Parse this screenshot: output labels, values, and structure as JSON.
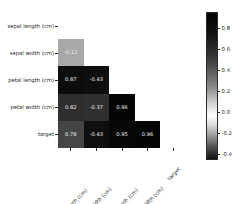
{
  "chart_data": {
    "type": "heatmap",
    "title": "",
    "xlabel": "",
    "ylabel": "",
    "mask": "lower-triangle",
    "grid": false,
    "annotated": true,
    "categories": [
      "sepal length (cm)",
      "sepal width (cm)",
      "petal length (cm)",
      "petal width (cm)",
      "target"
    ],
    "x_tick_labels": [
      "sepal length (cm)",
      "sepal width (cm)",
      "petal length (cm)",
      "petal width (cm)",
      "target"
    ],
    "y_tick_labels": [
      "sepal length (cm)",
      "sepal width (cm)",
      "petal length (cm)",
      "petal width (cm)",
      "target"
    ],
    "x_tick_rotation": -45,
    "rows": [
      {
        "label": "sepal length (cm)",
        "cells": []
      },
      {
        "label": "sepal width (cm)",
        "cells": [
          {
            "col": "sepal length (cm)",
            "value": -0.12,
            "text": "-0.12",
            "fill": "#a8a8a8",
            "text_color": "#e8e8e8"
          }
        ]
      },
      {
        "label": "petal length (cm)",
        "cells": [
          {
            "col": "sepal length (cm)",
            "value": 0.87,
            "text": "0.87",
            "fill": "#0d0d0d",
            "text_color": "#f2f2f2"
          },
          {
            "col": "sepal width (cm)",
            "value": -0.43,
            "text": "-0.43",
            "fill": "#0f0f0f",
            "text_color": "#f2f2f2"
          }
        ]
      },
      {
        "label": "petal width (cm)",
        "cells": [
          {
            "col": "sepal length (cm)",
            "value": 0.82,
            "text": "0.82",
            "fill": "#2e2e2e",
            "text_color": "#f2f2f2"
          },
          {
            "col": "sepal width (cm)",
            "value": -0.37,
            "text": "-0.37",
            "fill": "#303030",
            "text_color": "#f2f2f2"
          },
          {
            "col": "petal length (cm)",
            "value": 0.96,
            "text": "0.96",
            "fill": "#050505",
            "text_color": "#f7f7f7"
          }
        ]
      },
      {
        "label": "target",
        "cells": [
          {
            "col": "sepal length (cm)",
            "value": 0.78,
            "text": "0.78",
            "fill": "#454545",
            "text_color": "#f2f2f2"
          },
          {
            "col": "sepal width (cm)",
            "value": -0.43,
            "text": "-0.43",
            "fill": "#0f0f0f",
            "text_color": "#f2f2f2"
          },
          {
            "col": "petal length (cm)",
            "value": 0.95,
            "text": "0.95",
            "fill": "#070707",
            "text_color": "#f7f7f7"
          },
          {
            "col": "petal width (cm)",
            "value": 0.96,
            "text": "0.96",
            "fill": "#050505",
            "text_color": "#f7f7f7"
          }
        ]
      }
    ],
    "colorbar": {
      "orientation": "vertical",
      "position": "right",
      "vmin": -0.45,
      "vmax": 0.96,
      "colormap": "diverging-gray",
      "ticks": [
        {
          "value": 0.8,
          "label": "0.8"
        },
        {
          "value": 0.6,
          "label": "0.6"
        },
        {
          "value": 0.4,
          "label": "0.4"
        },
        {
          "value": 0.2,
          "label": "0.2"
        },
        {
          "value": 0.0,
          "label": "0.0"
        },
        {
          "value": -0.2,
          "label": "-0.2"
        },
        {
          "value": -0.4,
          "label": "-0.4"
        }
      ],
      "gradient_stops": [
        {
          "pos": 0,
          "color": "#000000"
        },
        {
          "pos": 14,
          "color": "#111111"
        },
        {
          "pos": 32,
          "color": "#3d3d3d"
        },
        {
          "pos": 50,
          "color": "#858585"
        },
        {
          "pos": 62,
          "color": "#d4d4d4"
        },
        {
          "pos": 70,
          "color": "#fdfdfd"
        },
        {
          "pos": 76,
          "color": "#e0e0e0"
        },
        {
          "pos": 84,
          "color": "#9a9a9a"
        },
        {
          "pos": 92,
          "color": "#4f4f4f"
        },
        {
          "pos": 100,
          "color": "#111111"
        }
      ]
    }
  },
  "style": {
    "background": "#ffffff",
    "text_color": "#262626"
  }
}
